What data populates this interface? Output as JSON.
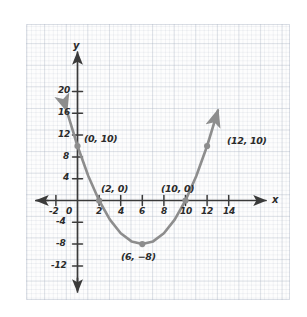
{
  "figure": {
    "kind": "hand-drawn coordinate graph on grid paper",
    "colors": {
      "curve": "#8d8d8d",
      "axis": "#3a3a3a",
      "text": "#2b2b2b",
      "grid_major": "#aab4c3",
      "grid_minor": "#96a2b4",
      "paper": "#fdfdfd"
    }
  },
  "axes": {
    "x_label": "x",
    "y_label": "y",
    "x_ticks": [
      "-2",
      "0",
      "2",
      "4",
      "6",
      "8",
      "10",
      "12",
      "14"
    ],
    "y_ticks": [
      "20",
      "16",
      "12",
      "8",
      "4",
      "-4",
      "-8",
      "-12"
    ],
    "x_arrow_left": true,
    "x_arrow_right": true,
    "y_arrow_up": true,
    "y_arrow_down": true
  },
  "chart_data": {
    "type": "line",
    "title": "",
    "xlabel": "x",
    "ylabel": "y",
    "xlim": [
      -3,
      15
    ],
    "ylim": [
      -14,
      22
    ],
    "grid": true,
    "legend": "none",
    "curve": {
      "name": "parabola",
      "equation": "y = 0.5(x - 2)(x - 10)",
      "vertex": [
        6,
        -8
      ],
      "roots": [
        2,
        10
      ],
      "y_intercept": 10,
      "arrow_start": true,
      "arrow_end": true,
      "x": [
        -1,
        0,
        1,
        2,
        3,
        4,
        5,
        6,
        7,
        8,
        9,
        10,
        11,
        12,
        13
      ],
      "y": [
        16.5,
        10,
        4.5,
        0,
        -3.5,
        -6,
        -7.5,
        -8,
        -7.5,
        -6,
        -3.5,
        0,
        4.5,
        10,
        16.5
      ]
    },
    "points": [
      {
        "id": "y-intercept",
        "x": 0,
        "y": 10,
        "label": "(0, 10)"
      },
      {
        "id": "root-left",
        "x": 2,
        "y": 0,
        "label": "(2, 0)"
      },
      {
        "id": "vertex",
        "x": 6,
        "y": -8,
        "label": "(6, −8)"
      },
      {
        "id": "root-right",
        "x": 10,
        "y": 0,
        "label": "(10, 0)"
      },
      {
        "id": "right-point",
        "x": 12,
        "y": 10,
        "label": "(12, 10)"
      }
    ]
  }
}
